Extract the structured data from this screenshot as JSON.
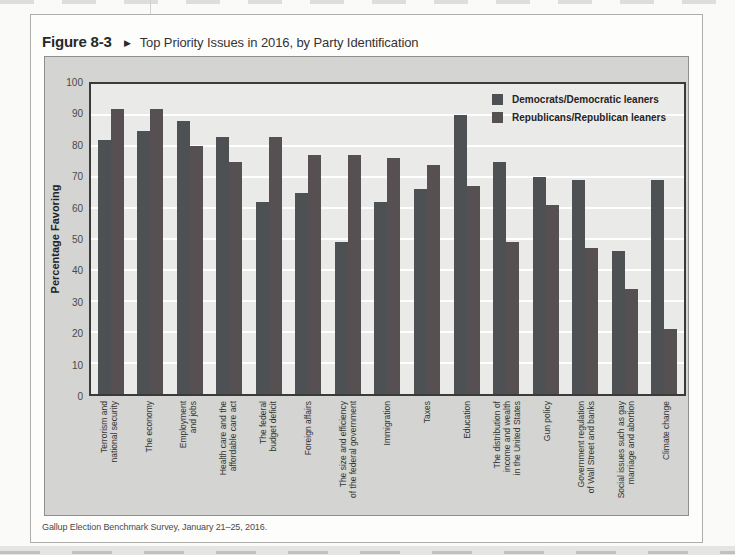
{
  "figure": {
    "label": "Figure 8-3",
    "arrow": "▶",
    "title": "Top Priority Issues in 2016, by Party Identification",
    "source": "Gallup Election Benchmark Survey, January 21–25, 2016."
  },
  "chart_data": {
    "type": "bar",
    "title": "Top Priority Issues in 2016, by Party Identification",
    "xlabel": "",
    "ylabel": "Percentage Favoring",
    "ylim": [
      0,
      100
    ],
    "ytick_step": 10,
    "grid": true,
    "legend_position": "top-right",
    "plot_bg": "#eaeae8",
    "panel_bg": "#d4d4d2",
    "gridline_color": "#ffffff",
    "categories": [
      [
        "Terrorism and",
        "national security"
      ],
      [
        "The economy"
      ],
      [
        "Employment",
        "and jobs"
      ],
      [
        "Health care and the",
        "affordable care act"
      ],
      [
        "The federal",
        "budget deficit"
      ],
      [
        "Foreign affairs"
      ],
      [
        "The size and efficiency",
        "of the federal government"
      ],
      [
        "Immigration"
      ],
      [
        "Taxes"
      ],
      [
        "Education"
      ],
      [
        "The distribution of",
        "income and wealth",
        "in the United States"
      ],
      [
        "Gun policy"
      ],
      [
        "Government regulation",
        "of Wall Street and banks"
      ],
      [
        "Social issues such as gay",
        "marriage and abortion"
      ],
      [
        "Climate change"
      ]
    ],
    "series": [
      {
        "name": "Democrats/Democratic leaners",
        "color": "#4d5154",
        "values": [
          82,
          85,
          88,
          83,
          62,
          65,
          49,
          62,
          66,
          90,
          75,
          70,
          69,
          46,
          69
        ]
      },
      {
        "name": "Republicans/Republican leaners",
        "color": "#565053",
        "values": [
          92,
          92,
          80,
          75,
          83,
          77,
          77,
          76,
          74,
          67,
          49,
          61,
          47,
          34,
          21
        ]
      }
    ]
  }
}
